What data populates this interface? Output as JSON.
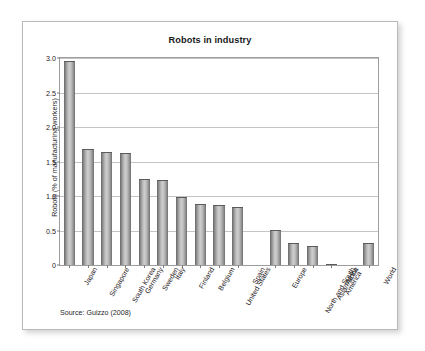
{
  "figure": {
    "title": "Robots in industry",
    "source": "Source: Guizzo (2008)"
  },
  "chart_data": {
    "type": "bar",
    "title": "Robots in industry",
    "xlabel": "",
    "ylabel": "Robots (% of manufacturing workers)",
    "ylim": [
      0,
      3.0
    ],
    "yticks": [
      "0",
      "0.5",
      "1.0",
      "1.5",
      "2.0",
      "2.5",
      "3.0"
    ],
    "ytick_values": [
      0,
      0.5,
      1.0,
      1.5,
      2.0,
      2.5,
      3.0
    ],
    "grid": true,
    "legend": "none",
    "categories": [
      "Japan",
      "Singapore",
      "South Korea",
      "Germany",
      "Sweden",
      "Italy",
      "Finland",
      "Belgium",
      "United States",
      "Spain",
      "Europe",
      "North and South\nAmerica",
      "Asia/Pacific",
      "Africa",
      "World"
    ],
    "values": [
      2.95,
      1.68,
      1.64,
      1.62,
      1.25,
      1.23,
      0.98,
      0.89,
      0.87,
      0.84,
      0.51,
      0.32,
      0.28,
      0.02,
      0.32
    ],
    "group_gaps_after": [
      9,
      13
    ],
    "bar_color": "#b0b0b0",
    "annotation": "Source: Guizzo (2008)"
  }
}
